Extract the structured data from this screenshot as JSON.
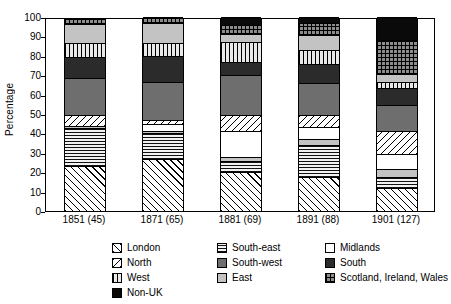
{
  "chart_data": {
    "type": "bar",
    "title": "",
    "xlabel": "",
    "ylabel": "Percentage",
    "ylim": [
      0,
      100
    ],
    "yticks": [
      100,
      90,
      80,
      70,
      60,
      50,
      40,
      30,
      20,
      10,
      0
    ],
    "grid": false,
    "stacked": true,
    "legend_position": "bottom",
    "categories": [
      "1851 (45)",
      "1871 (65)",
      "1881 (69)",
      "1891 (88)",
      "1901 (127)"
    ],
    "series": [
      {
        "name": "London",
        "values": [
          23.0,
          27.0,
          20.0,
          17.5,
          12.0
        ]
      },
      {
        "name": "South-east",
        "values": [
          20.0,
          13.0,
          6.0,
          16.5,
          5.5
        ]
      },
      {
        "name": "East",
        "values": [
          1.0,
          1.0,
          2.0,
          3.0,
          4.0
        ]
      },
      {
        "name": "Midlands",
        "values": [
          0.0,
          4.0,
          13.0,
          6.5,
          8.0
        ]
      },
      {
        "name": "North",
        "values": [
          5.5,
          2.0,
          8.5,
          6.0,
          12.0
        ]
      },
      {
        "name": "South-west",
        "values": [
          19.0,
          19.5,
          20.5,
          16.5,
          13.0
        ]
      },
      {
        "name": "South",
        "values": [
          11.0,
          13.5,
          7.0,
          10.0,
          9.0
        ]
      },
      {
        "name": "West",
        "values": [
          7.0,
          6.5,
          10.0,
          7.0,
          3.0
        ]
      },
      {
        "name": "East (upper)",
        "values": [
          10.0,
          10.5,
          4.0,
          7.5,
          4.0
        ]
      },
      {
        "name": "Scotland, Ireland, Wales",
        "values": [
          3.0,
          3.0,
          5.0,
          6.5,
          17.5
        ]
      },
      {
        "name": "Non-UK",
        "values": [
          0.0,
          0.0,
          4.0,
          3.0,
          12.0
        ]
      }
    ],
    "legend": [
      {
        "label": "London",
        "pattern": "diagonal-hatch"
      },
      {
        "label": "South-east",
        "pattern": "horizontal-lines"
      },
      {
        "label": "Midlands",
        "pattern": "white"
      },
      {
        "label": "North",
        "pattern": "reverse-diagonal-hatch"
      },
      {
        "label": "South-west",
        "pattern": "medium-gray"
      },
      {
        "label": "South",
        "pattern": "dark-gray"
      },
      {
        "label": "West",
        "pattern": "vertical-lines"
      },
      {
        "label": "East",
        "pattern": "light-gray"
      },
      {
        "label": "Scotland, Ireland, Wales",
        "pattern": "crosshatch-grid"
      },
      {
        "label": "Non-UK",
        "pattern": "solid-black"
      }
    ]
  }
}
